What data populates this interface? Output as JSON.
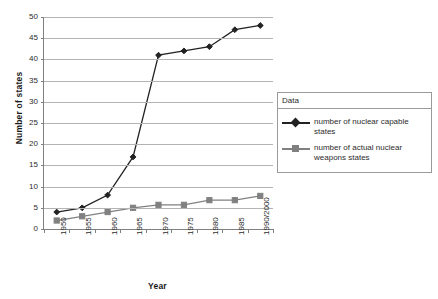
{
  "chart_data": {
    "type": "line",
    "title": "",
    "xlabel": "Year",
    "ylabel": "Number of states",
    "categories": [
      "1950",
      "1955",
      "1960",
      "1965",
      "1970",
      "1975",
      "1980",
      "1985",
      "1990/2000"
    ],
    "ylim": [
      0,
      50
    ],
    "yticks": [
      0,
      5,
      10,
      15,
      20,
      25,
      30,
      35,
      40,
      45,
      50
    ],
    "ytick_labels": [
      "0",
      "5",
      "10",
      "15",
      "20",
      "25",
      "30",
      "35",
      "40",
      "45",
      "50"
    ],
    "grid": "horizontal",
    "legend_position": "right",
    "legend_title": "Data",
    "series": [
      {
        "name": "number of nuclear capable states",
        "values": [
          4,
          5,
          8,
          17,
          41,
          42,
          43,
          47,
          48
        ],
        "color": "#222222",
        "marker": "diamond"
      },
      {
        "name": "number of actual nuclear weapons states",
        "values": [
          2,
          3,
          4,
          5,
          5.7,
          5.7,
          6.8,
          6.8,
          7.8
        ],
        "color": "#808080",
        "marker": "square"
      }
    ]
  },
  "colors": {
    "axis": "#808080",
    "gridline": "#b4b4b4",
    "series1": "#222222",
    "series2": "#808080",
    "legend_border": "#9a9a9a",
    "background": "#ffffff"
  }
}
